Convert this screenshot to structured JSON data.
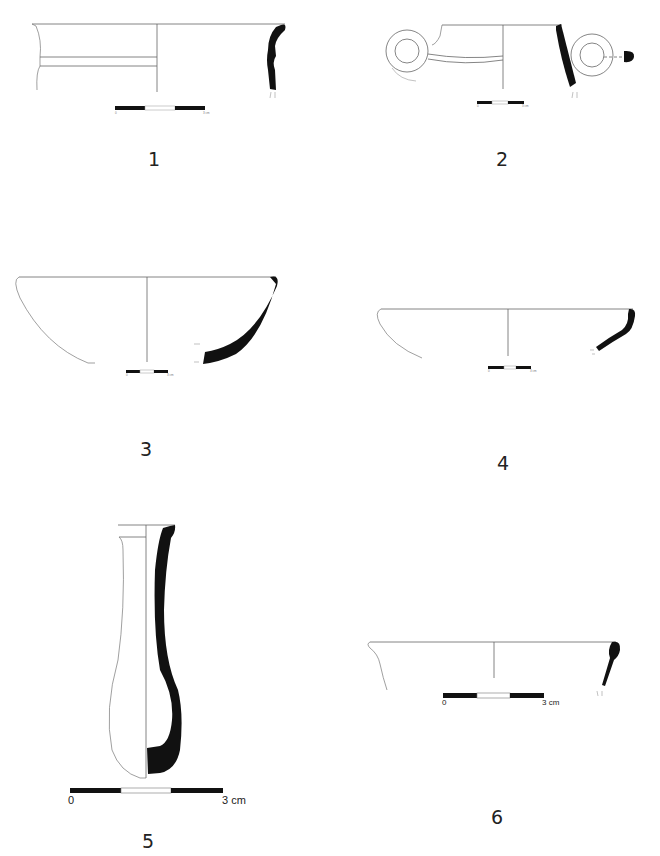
{
  "plate": {
    "figures": [
      {
        "id": "1",
        "label": "1",
        "type": "rim sherd (jar/krater profile)",
        "scale": {
          "start": "0",
          "end": "3 cm"
        }
      },
      {
        "id": "2",
        "label": "2",
        "type": "bowl with loop handles",
        "scale": {
          "start": "0",
          "end": "3 cm"
        }
      },
      {
        "id": "3",
        "label": "3",
        "type": "hemispherical bowl",
        "scale": {
          "start": "0",
          "end": "3 cm"
        }
      },
      {
        "id": "4",
        "label": "4",
        "type": "shallow bowl",
        "scale": {
          "start": "0",
          "end": "3 cm"
        }
      },
      {
        "id": "5",
        "label": "5",
        "type": "unguentarium / bottle",
        "scale": {
          "start": "0",
          "end": "3 cm"
        }
      },
      {
        "id": "6",
        "label": "6",
        "type": "shallow dish rim",
        "scale": {
          "start": "0",
          "end": "3 cm"
        }
      }
    ]
  },
  "colors": {
    "ink": "#111111",
    "line": "#555555",
    "background": "#ffffff"
  }
}
